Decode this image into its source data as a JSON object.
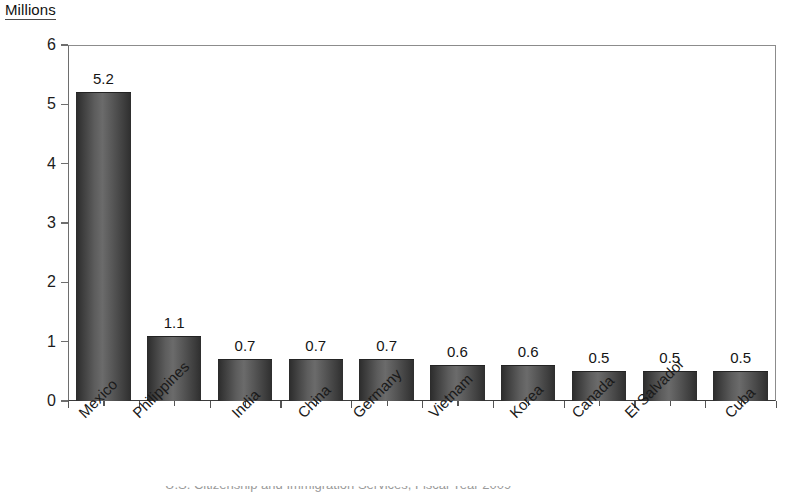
{
  "chart_data": {
    "type": "bar",
    "title": "Millions",
    "xlabel": "",
    "ylabel": "Millions",
    "ylim": [
      0,
      6
    ],
    "y_ticks": [
      0,
      1,
      2,
      3,
      4,
      5,
      6
    ],
    "grid": false,
    "legend": null,
    "categories": [
      "Mexico",
      "Philippines",
      "India",
      "China",
      "Germany",
      "Vietnam",
      "Korea",
      "Canada",
      "El Salvador",
      "Cuba"
    ],
    "values": [
      5.2,
      1.1,
      0.7,
      0.7,
      0.7,
      0.6,
      0.6,
      0.5,
      0.5,
      0.5
    ],
    "value_labels": [
      "5.2",
      "1.1",
      "0.7",
      "0.7",
      "0.7",
      "0.6",
      "0.6",
      "0.5",
      "0.5",
      "0.5"
    ],
    "bar_color": "#5d5d5d",
    "bar_edge_color": "#232323",
    "axis_color": "#6e6e6e",
    "text_color": "#1a1a1a",
    "background": "#ffffff"
  },
  "axis": {
    "unit_title": "Millions",
    "y_tick_labels": [
      "6",
      "5",
      "4",
      "3",
      "2",
      "1",
      "0"
    ]
  },
  "footer": {
    "caption": "U.S. Citizenship and Immigration Services, Fiscal Year 2009"
  }
}
